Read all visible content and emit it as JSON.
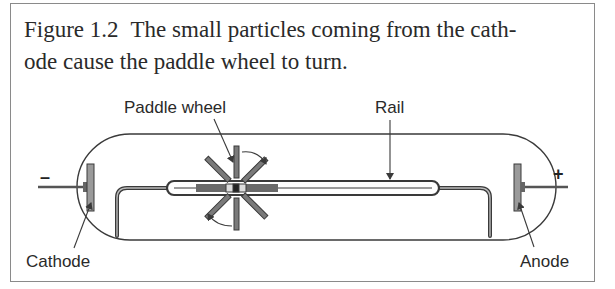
{
  "figure": {
    "number": "Figure 1.2",
    "caption_line1": "The small particles coming from the cath-",
    "caption_line2": "ode cause the paddle wheel to turn."
  },
  "diagram": {
    "labels": {
      "paddle_wheel": "Paddle wheel",
      "rail": "Rail",
      "cathode": "Cathode",
      "anode": "Anode"
    },
    "signs": {
      "cathode": "–",
      "anode": "+"
    },
    "colors": {
      "line": "#3a3a3a",
      "plate_fill": "#9a9a9a",
      "rail_fill": "#6a6a6a",
      "border": "#8a8a8a"
    }
  }
}
